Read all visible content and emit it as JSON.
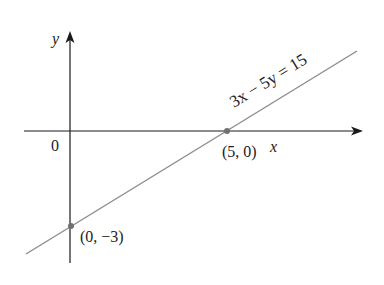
{
  "diagram": {
    "equation": "3x − 5y = 15",
    "origin_label": "0",
    "x_axis_label": "x",
    "y_axis_label": "y",
    "points": [
      {
        "label": "(5, 0)",
        "x": 5,
        "y": 0
      },
      {
        "label": "(0, −3)",
        "x": 0,
        "y": -3
      }
    ],
    "colors": {
      "axis": "#1a1a1a",
      "line": "#8c8c8c",
      "point": "#707070"
    }
  }
}
